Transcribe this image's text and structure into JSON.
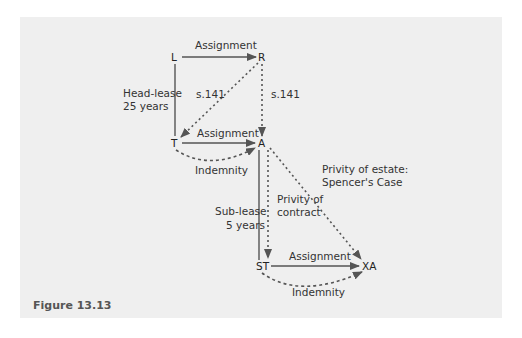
{
  "figure": {
    "caption": "Figure 13.13",
    "background_color": "#efefef",
    "line_color": "#555555"
  },
  "nodes": {
    "L": "L",
    "R": "R",
    "T": "T",
    "A": "A",
    "ST": "ST",
    "XA": "XA"
  },
  "edges": [
    {
      "from": "L",
      "to": "R",
      "style": "solid-arrow",
      "label": "Assignment"
    },
    {
      "from": "L",
      "to": "T",
      "style": "solid-line",
      "label": "Head-lease 25 years"
    },
    {
      "from": "R",
      "to": "T",
      "style": "dotted-arrow",
      "label": "s.141"
    },
    {
      "from": "R",
      "to": "A",
      "style": "dotted-arrow",
      "label": "s.141"
    },
    {
      "from": "T",
      "to": "A",
      "style": "solid-arrow",
      "label": "Assignment"
    },
    {
      "from": "T",
      "to": "A",
      "style": "dashed-curve-arrow",
      "label": "Indemnity"
    },
    {
      "from": "A",
      "to": "ST",
      "style": "solid-line",
      "label": "Sub-lease 5 years"
    },
    {
      "from": "A",
      "to": "ST",
      "style": "dotted-arrow",
      "label": "Privity of contract"
    },
    {
      "from": "A",
      "to": "XA",
      "style": "dotted-arrow",
      "label": "Privity of estate: Spencer's Case"
    },
    {
      "from": "ST",
      "to": "XA",
      "style": "solid-arrow",
      "label": "Assignment"
    },
    {
      "from": "ST",
      "to": "XA",
      "style": "dashed-curve-arrow",
      "label": "Indemnity"
    }
  ],
  "labels": {
    "assignment_LR": "Assignment",
    "headlease_line1": "Head-lease",
    "headlease_line2": "25 years",
    "s141_left": "s.141",
    "s141_right": "s.141",
    "assignment_TA": "Assignment",
    "indemnity_TA": "Indemnity",
    "privity_estate_line1": "Privity of estate:",
    "privity_estate_line2": "Spencer's Case",
    "privity_contract_line1": "Privity of",
    "privity_contract_line2": "contract",
    "sublease_line1": "Sub-lease",
    "sublease_line2": "5 years",
    "assignment_STXA": "Assignment",
    "indemnity_STXA": "Indemnity"
  }
}
